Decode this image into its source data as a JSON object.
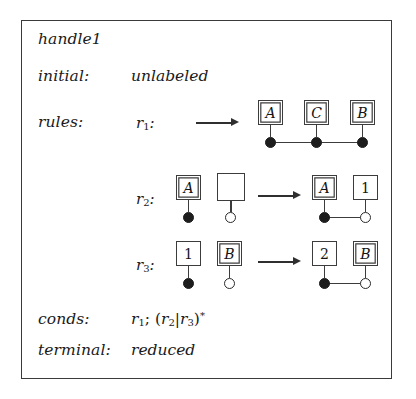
{
  "figure": {
    "title": "handle1",
    "border_color": "#3a3a3a",
    "rows": {
      "initial_label": "initial:",
      "initial_value": "unlabeled",
      "rules_label": "rules:",
      "conds_label": "conds:",
      "terminal_label": "terminal:",
      "terminal_value": "reduced"
    },
    "conds_expression": {
      "r1": "r",
      "r1_sub": "1",
      "semicolon": ";",
      "open_paren": "(",
      "r2": "r",
      "r2_sub": "2",
      "bar": "|",
      "r3": "r",
      "r3_sub": "3",
      "close_paren": ")",
      "star": "*"
    },
    "rules": [
      {
        "name": "r",
        "name_sub": "1",
        "colon": ":",
        "arrow": "→",
        "lhs": {
          "nodes": []
        },
        "rhs": {
          "nodes": [
            {
              "label": "A",
              "box_style": "double",
              "dot": "filled"
            },
            {
              "label": "C",
              "box_style": "double",
              "dot": "filled"
            },
            {
              "label": "B",
              "box_style": "double",
              "dot": "filled"
            }
          ],
          "links": [
            [
              0,
              1
            ],
            [
              1,
              2
            ]
          ]
        }
      },
      {
        "name": "r",
        "name_sub": "2",
        "colon": ":",
        "arrow": "→",
        "lhs": {
          "nodes": [
            {
              "label": "A",
              "box_style": "double",
              "dot": "filled"
            },
            {
              "label": "",
              "box_style": "single",
              "dot": "hollow"
            }
          ],
          "links": []
        },
        "rhs": {
          "nodes": [
            {
              "label": "A",
              "box_style": "double",
              "dot": "filled"
            },
            {
              "label": "1",
              "box_style": "single",
              "dot": "hollow"
            }
          ],
          "links": [
            [
              0,
              1
            ]
          ]
        }
      },
      {
        "name": "r",
        "name_sub": "3",
        "colon": ":",
        "arrow": "→",
        "lhs": {
          "nodes": [
            {
              "label": "1",
              "box_style": "single",
              "dot": "filled"
            },
            {
              "label": "B",
              "box_style": "double",
              "dot": "hollow"
            }
          ],
          "links": []
        },
        "rhs": {
          "nodes": [
            {
              "label": "2",
              "box_style": "single",
              "dot": "filled"
            },
            {
              "label": "B",
              "box_style": "double",
              "dot": "hollow"
            }
          ],
          "links": [
            [
              0,
              1
            ]
          ]
        }
      }
    ]
  }
}
